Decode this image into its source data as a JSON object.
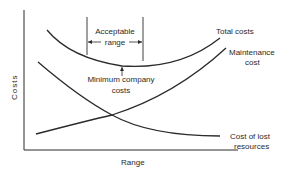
{
  "diagram": {
    "axes": {
      "y_label": "Costs",
      "x_label": "Range"
    },
    "annotation": {
      "acceptable_range_line1": "Acceptable",
      "acceptable_range_line2": "range",
      "minimum_line1": "Minimum company",
      "minimum_line2": "costs"
    },
    "curves": {
      "total": "Total costs",
      "maintenance_line1": "Maintenance",
      "maintenance_line2": "cost",
      "lost_line1": "Cost of lost",
      "lost_line2": "resources"
    },
    "colors": {
      "stroke": "#2a2a2a",
      "background": "#ffffff"
    }
  }
}
